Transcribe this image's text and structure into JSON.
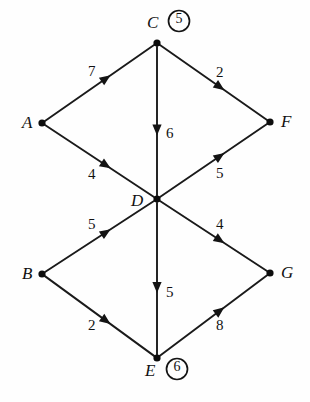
{
  "figure": {
    "kind": "directed-weighted-graph",
    "width": 310,
    "height": 402,
    "background_color": "#fefefe",
    "ink_color": "#111111"
  },
  "graph_data": {
    "type": "diagram",
    "directed": true,
    "weighted": true,
    "nodes": [
      {
        "id": "A",
        "label": "A",
        "x": 42,
        "y": 123,
        "label_x": 22,
        "label_y": 114,
        "annotation": null
      },
      {
        "id": "B",
        "label": "B",
        "x": 42,
        "y": 274,
        "label_x": 22,
        "label_y": 265,
        "annotation": null
      },
      {
        "id": "C",
        "label": "C",
        "x": 157,
        "y": 43,
        "label_x": 147,
        "label_y": 14,
        "annotation": "5",
        "annotation_x": 169,
        "annotation_y": 12
      },
      {
        "id": "D",
        "label": "D",
        "x": 157,
        "y": 199,
        "label_x": 131,
        "label_y": 192,
        "annotation": null
      },
      {
        "id": "E",
        "label": "E",
        "x": 157,
        "y": 358,
        "label_x": 145,
        "label_y": 362,
        "annotation": "6",
        "annotation_x": 167,
        "annotation_y": 360
      },
      {
        "id": "F",
        "label": "F",
        "x": 270,
        "y": 122,
        "label_x": 281,
        "label_y": 113,
        "annotation": null
      },
      {
        "id": "G",
        "label": "G",
        "x": 270,
        "y": 273,
        "label_x": 281,
        "label_y": 264,
        "annotation": null
      }
    ],
    "edges": [
      {
        "id": "A-C",
        "from": "A",
        "to": "C",
        "weight": "7",
        "label_x": 88,
        "label_y": 64
      },
      {
        "id": "C-F",
        "from": "C",
        "to": "F",
        "weight": "2",
        "label_x": 216,
        "label_y": 65
      },
      {
        "id": "C-D",
        "from": "C",
        "to": "D",
        "weight": "6",
        "label_x": 166,
        "label_y": 126
      },
      {
        "id": "A-D",
        "from": "A",
        "to": "D",
        "weight": "4",
        "label_x": 88,
        "label_y": 167
      },
      {
        "id": "D-F",
        "from": "D",
        "to": "F",
        "weight": "5",
        "label_x": 216,
        "label_y": 166
      },
      {
        "id": "B-D",
        "from": "B",
        "to": "D",
        "weight": "5",
        "label_x": 88,
        "label_y": 217
      },
      {
        "id": "D-G",
        "from": "D",
        "to": "G",
        "weight": "4",
        "label_x": 216,
        "label_y": 217
      },
      {
        "id": "B-E",
        "from": "B",
        "to": "E",
        "weight": "2",
        "label_x": 88,
        "label_y": 318
      },
      {
        "id": "D-E",
        "from": "D",
        "to": "E",
        "weight": "5",
        "label_x": 166,
        "label_y": 285
      },
      {
        "id": "E-G",
        "from": "E",
        "to": "G",
        "weight": "8",
        "label_x": 216,
        "label_y": 318
      }
    ],
    "node_count": 7,
    "edge_count": 10,
    "annotations": [
      {
        "node": "C",
        "circled_value": "5"
      },
      {
        "node": "E",
        "circled_value": "6"
      }
    ]
  }
}
